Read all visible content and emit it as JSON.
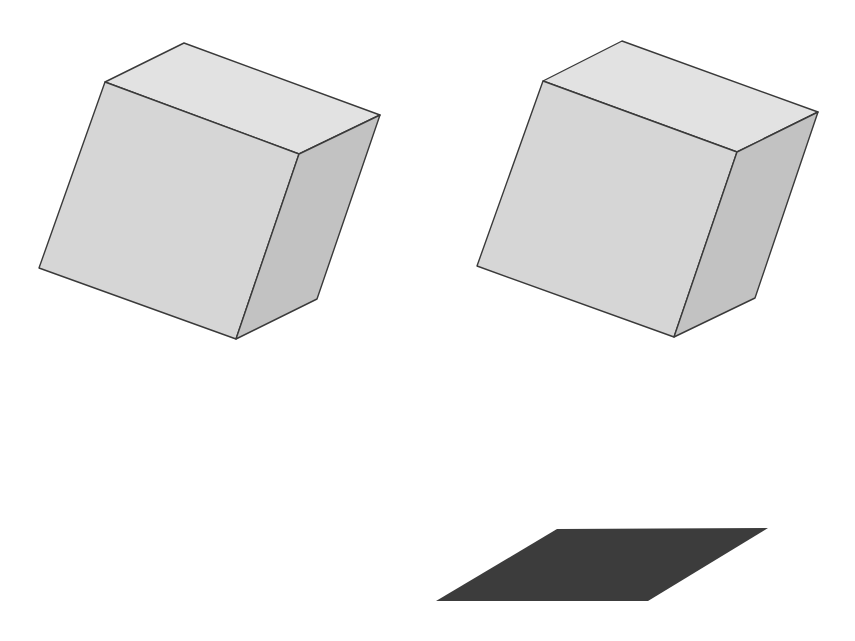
{
  "figure": {
    "background": "#ffffff",
    "colors": {
      "top_face": "#e2e2e2",
      "front_face": "#d6d6d6",
      "side_face": "#c2c2c2",
      "edge": "#3a3a3a",
      "shadow": "#3c3c3c"
    },
    "shapes": [
      {
        "id": "cube-left",
        "kind": "cube",
        "vertices": {
          "top_back_left": [
            184,
            43
          ],
          "top_back_right": [
            380,
            115
          ],
          "top_front_left": [
            105,
            82
          ],
          "top_front_right": [
            299,
            154
          ],
          "bottom_front_left": [
            39,
            268
          ],
          "bottom_front_right": [
            236,
            339
          ],
          "bottom_back_right": [
            317,
            299
          ]
        }
      },
      {
        "id": "cube-right",
        "kind": "cube",
        "vertices": {
          "top_back_left": [
            622,
            41
          ],
          "top_back_right": [
            818,
            112
          ],
          "top_front_left": [
            543,
            81
          ],
          "top_front_right": [
            737,
            152
          ],
          "bottom_front_left": [
            477,
            266
          ],
          "bottom_front_right": [
            674,
            337
          ],
          "bottom_back_right": [
            755,
            298
          ]
        }
      },
      {
        "id": "shadow-parallelogram",
        "kind": "parallelogram",
        "vertices": [
          [
            557,
            529
          ],
          [
            768,
            528
          ],
          [
            648,
            601
          ],
          [
            436,
            601
          ]
        ]
      }
    ]
  }
}
